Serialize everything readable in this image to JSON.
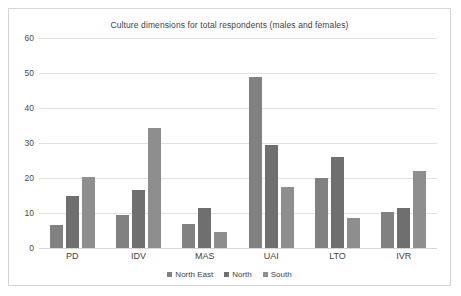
{
  "chart_data": {
    "type": "bar",
    "title": "Culture dimensions for total respondents (males and females)",
    "xlabel": "",
    "ylabel": "",
    "ylim": [
      0,
      60
    ],
    "yticks": [
      0,
      10,
      20,
      30,
      40,
      50,
      60
    ],
    "grid": true,
    "legend_position": "bottom",
    "categories": [
      "PD",
      "IDV",
      "MAS",
      "UAI",
      "LTO",
      "IVR"
    ],
    "series": [
      {
        "name": "North East",
        "color": "#818181",
        "values": [
          6.5,
          9.5,
          7.0,
          48.8,
          20.0,
          10.3
        ]
      },
      {
        "name": "North",
        "color": "#6f6f6f",
        "values": [
          15.0,
          16.7,
          11.5,
          29.3,
          26.0,
          11.5
        ]
      },
      {
        "name": "South",
        "color": "#8e8e8e",
        "values": [
          20.2,
          34.3,
          4.5,
          17.5,
          8.5,
          22.0
        ]
      }
    ]
  }
}
